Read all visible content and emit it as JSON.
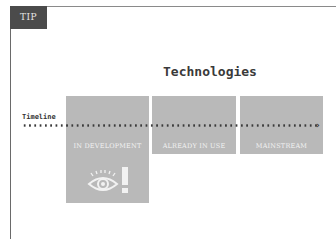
{
  "tip_label": "TIP",
  "title": "Technologies",
  "timeline": {
    "label": "Timeline",
    "arrow": "›"
  },
  "stages": [
    {
      "label": "IN DEVELOPMENT",
      "icon": "eye-alert-icon"
    },
    {
      "label": "ALREADY IN USE"
    },
    {
      "label": "MAINSTREAM"
    }
  ],
  "colors": {
    "box": "#b9b9b9",
    "tip_bg": "#4b4b4b",
    "text": "#3a3a3a"
  }
}
